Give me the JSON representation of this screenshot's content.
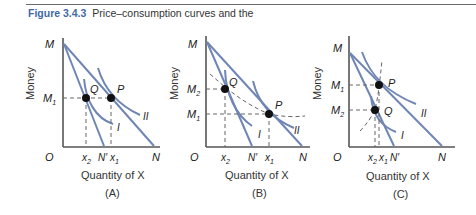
{
  "figure": {
    "number": "Figure 3.4.3",
    "caption": "Price–consumption curves and the"
  },
  "colors": {
    "curve": "#6f86b5",
    "axis": "#555555",
    "dashed": "#666666",
    "point": "#111111",
    "figure_label": "#3f6aa8"
  },
  "panels": [
    {
      "id": "A",
      "label": "(A)",
      "x_axis_label": "Quantity of X",
      "y_axis_label": "Money",
      "origin_label": "O",
      "y_ticks": [
        "M",
        "M₁"
      ],
      "x_ticks": [
        "x₂",
        "N′",
        "x₁",
        "N"
      ],
      "points": [
        "Q",
        "P"
      ],
      "curves": [
        "I",
        "II"
      ]
    },
    {
      "id": "B",
      "label": "(B)",
      "x_axis_label": "Quantity of X",
      "y_axis_label": "Money",
      "origin_label": "O",
      "y_ticks": [
        "M",
        "M₂",
        "M₁"
      ],
      "x_ticks": [
        "x₂",
        "N′",
        "x₁",
        "N"
      ],
      "points": [
        "Q",
        "P"
      ],
      "curves": [
        "I",
        "II"
      ]
    },
    {
      "id": "C",
      "label": "(C)",
      "x_axis_label": "Quantity of X",
      "y_axis_label": "Money",
      "origin_label": "O",
      "y_ticks": [
        "M",
        "M₁",
        "M₂"
      ],
      "x_ticks": [
        "x₂x₁",
        "N′",
        "N"
      ],
      "points": [
        "P",
        "Q"
      ],
      "curves": [
        "I",
        "II"
      ]
    }
  ],
  "labels": {
    "M": "M",
    "M1": "M",
    "M2": "M",
    "sub1": "1",
    "sub2": "2",
    "O": "O",
    "x": "x",
    "Nprime": "N′",
    "N": "N",
    "P": "P",
    "Q": "Q",
    "I": "I",
    "II": "II",
    "money": "Money",
    "quantity": "Quantity of X",
    "A": "(A)",
    "B": "(B)",
    "C": "(C)"
  }
}
